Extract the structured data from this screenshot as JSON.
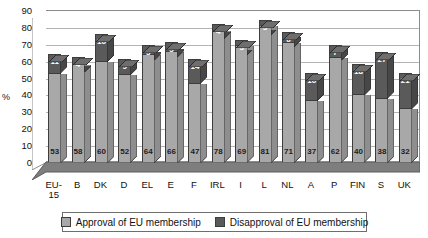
{
  "chart_data": {
    "type": "bar",
    "subtype": "stacked-column-3d",
    "title": "",
    "xlabel": "",
    "ylabel": "%",
    "ylim": [
      0,
      90
    ],
    "ytick_step": 10,
    "yticks": [
      90,
      80,
      70,
      60,
      50,
      40,
      30,
      20,
      10,
      0
    ],
    "grid": true,
    "legend_position": "bottom",
    "categories": [
      "EU-15",
      "B",
      "DK",
      "D",
      "EL",
      "E",
      "F",
      "IRL",
      "I",
      "L",
      "NL",
      "A",
      "P",
      "FIN",
      "S",
      "UK"
    ],
    "series": [
      {
        "name": "Approval of EU membership",
        "color": "#a8a8a8",
        "values": [
          53,
          58,
          60,
          52,
          64,
          66,
          47,
          78,
          69,
          81,
          71,
          37,
          62,
          40,
          38,
          32
        ]
      },
      {
        "name": "Disapproval of EU membership",
        "color": "#5a5a5a",
        "values": [
          11,
          4,
          16,
          9,
          5,
          5,
          14,
          4,
          3,
          3,
          6,
          16,
          7,
          18,
          27,
          21
        ]
      }
    ]
  },
  "legend": {
    "items": [
      {
        "label": "Approval of EU membership"
      },
      {
        "label": "Disapproval of EU membership"
      }
    ]
  }
}
